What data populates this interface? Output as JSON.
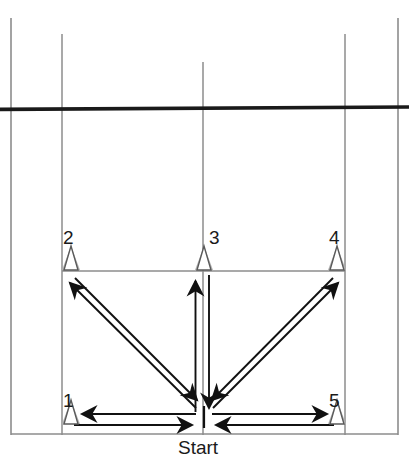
{
  "diagram": {
    "start_label": "Start",
    "colors": {
      "court_line": "#8c8c8c",
      "bold_line": "#1a1a1a",
      "arrow": "#111111",
      "cone_outline": "#5a5a5a",
      "cone_shade": "#b3b3b3",
      "text": "#1a1a1a",
      "background": "#ffffff"
    },
    "cones": [
      {
        "id": "cone-1",
        "label": "1",
        "x": 71,
        "y": 424,
        "label_x": 63,
        "label_y": 391
      },
      {
        "id": "cone-2",
        "label": "2",
        "x": 71,
        "y": 270,
        "label_x": 63,
        "label_y": 228
      },
      {
        "id": "cone-3",
        "label": "3",
        "x": 204,
        "y": 270,
        "label_x": 209,
        "label_y": 228
      },
      {
        "id": "cone-4",
        "label": "4",
        "x": 337,
        "y": 270,
        "label_x": 329,
        "label_y": 228
      },
      {
        "id": "cone-5",
        "label": "5",
        "x": 337,
        "y": 424,
        "label_x": 329,
        "label_y": 391
      }
    ],
    "start_point": {
      "x": 204,
      "y": 421,
      "label_x": 204,
      "label_y": 443
    },
    "court_lines": {
      "left_border": {
        "x": 11,
        "y1": 18,
        "y2": 435
      },
      "right_border": {
        "x": 398,
        "y1": 18,
        "y2": 435
      },
      "inner_left": {
        "x": 62,
        "y1": 34,
        "y2": 435
      },
      "inner_right": {
        "x": 345,
        "y1": 34,
        "y2": 435
      },
      "center_line": {
        "x": 203,
        "y1": 62,
        "y2": 435
      },
      "service_line": {
        "y": 271,
        "x1": 62,
        "x2": 345
      },
      "baseline": {
        "y": 434,
        "x1": 11,
        "x2": 398
      },
      "net_line": {
        "y": 108,
        "x1": 2,
        "x2": 407
      }
    },
    "routes": [
      {
        "name": "start-to-cone-2",
        "direction": "out",
        "from": "start",
        "to": "cone-2"
      },
      {
        "name": "cone-2-to-start",
        "direction": "return",
        "from": "cone-2",
        "to": "start"
      },
      {
        "name": "start-to-cone-3",
        "direction": "out",
        "from": "start",
        "to": "cone-3"
      },
      {
        "name": "cone-3-to-start",
        "direction": "return",
        "from": "cone-3",
        "to": "start"
      },
      {
        "name": "start-to-cone-4",
        "direction": "out",
        "from": "start",
        "to": "cone-4"
      },
      {
        "name": "cone-4-to-start",
        "direction": "return",
        "from": "cone-4",
        "to": "start"
      },
      {
        "name": "start-to-cone-1",
        "direction": "out",
        "from": "start",
        "to": "cone-1"
      },
      {
        "name": "cone-1-to-start",
        "direction": "return",
        "from": "cone-1",
        "to": "start"
      },
      {
        "name": "start-to-cone-5",
        "direction": "out",
        "from": "start",
        "to": "cone-5"
      },
      {
        "name": "cone-5-to-start",
        "direction": "return",
        "from": "cone-5",
        "to": "start"
      }
    ]
  }
}
